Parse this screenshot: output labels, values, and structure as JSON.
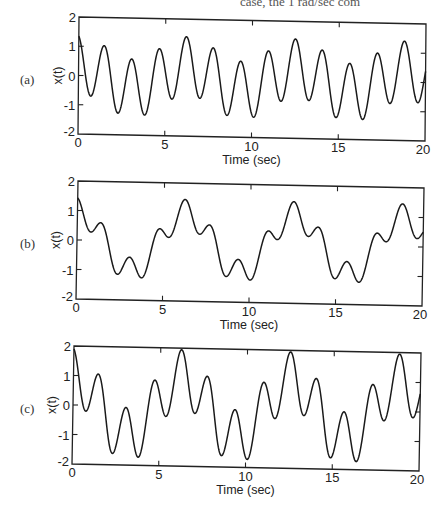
{
  "page": {
    "top_text_fragment": "case, the 1 rad/sec com"
  },
  "chart_data": [
    {
      "type": "line",
      "panel_label": "(a)",
      "title": "",
      "xlabel": "Time (sec)",
      "ylabel": "x(t)",
      "xlim": [
        0,
        20
      ],
      "ylim": [
        -2,
        2
      ],
      "xticks": [
        "0",
        "5",
        "10",
        "15",
        "20"
      ],
      "yticks": [
        "2",
        "1",
        "0",
        "-1",
        "-2"
      ],
      "grid": false,
      "legend": null,
      "components": [
        {
          "freq_rad_per_sec": 1,
          "amplitude": 0.4,
          "phase": 0.0
        },
        {
          "freq_rad_per_sec": 4,
          "amplitude": 1.0,
          "phase": 0.33
        },
        {
          "freq_rad_per_sec": 2,
          "amplitude": 0.0,
          "phase": 0.0
        }
      ],
      "extrema_points": [
        [
          0,
          0.95
        ],
        [
          0.6,
          -0.6
        ],
        [
          1.4,
          1.1
        ],
        [
          2.2,
          -1.3
        ],
        [
          3.0,
          0.45
        ],
        [
          3.7,
          -1.5
        ],
        [
          4.6,
          0.8
        ],
        [
          5.3,
          -0.8
        ],
        [
          6.2,
          1.4
        ],
        [
          7.0,
          -0.65
        ],
        [
          7.8,
          1.05
        ],
        [
          8.5,
          -1.3
        ],
        [
          9.2,
          0.35
        ],
        [
          9.9,
          -1.55
        ],
        [
          10.9,
          0.7
        ],
        [
          11.6,
          -0.95
        ],
        [
          12.5,
          1.4
        ],
        [
          13.2,
          -0.4
        ],
        [
          13.9,
          1.15
        ],
        [
          14.8,
          -1.2
        ],
        [
          15.6,
          0.45
        ],
        [
          16.2,
          -1.7
        ],
        [
          17.1,
          0.8
        ],
        [
          17.9,
          -0.85
        ],
        [
          18.8,
          1.25
        ],
        [
          19.5,
          -0.5
        ],
        [
          20,
          0.85
        ]
      ],
      "box": {
        "x0": 79,
        "y0": 17,
        "x1": 426,
        "y1": 24,
        "bl_x": 78,
        "bl_y": 134,
        "br_y": 141
      }
    },
    {
      "type": "line",
      "panel_label": "(b)",
      "title": "",
      "xlabel": "Time (sec)",
      "ylabel": "x(t)",
      "xlim": [
        0,
        20
      ],
      "ylim": [
        -2,
        2
      ],
      "xticks": [
        "0",
        "5",
        "10",
        "15",
        "20"
      ],
      "yticks": [
        "2",
        "1",
        "0",
        "-1",
        "-2"
      ],
      "grid": false,
      "legend": null,
      "components": [
        {
          "freq_rad_per_sec": 1,
          "amplitude": 1.0,
          "phase": 0.0
        },
        {
          "freq_rad_per_sec": 4,
          "amplitude": 0.45,
          "phase": 0.33
        },
        {
          "freq_rad_per_sec": 2,
          "amplitude": 0.0,
          "phase": 0.0
        }
      ],
      "extrema_points": [
        [
          0,
          1.2
        ],
        [
          0.5,
          0.35
        ],
        [
          1.3,
          0.8
        ],
        [
          2.3,
          -1.05
        ],
        [
          3.0,
          -0.5
        ],
        [
          3.7,
          -1.45
        ],
        [
          4.6,
          0.25
        ],
        [
          5.2,
          -0.1
        ],
        [
          6.2,
          1.45
        ],
        [
          7.0,
          0.3
        ],
        [
          7.7,
          0.75
        ],
        [
          8.5,
          -1.05
        ],
        [
          9.2,
          -0.55
        ],
        [
          9.9,
          -1.5
        ],
        [
          10.9,
          0.2
        ],
        [
          11.5,
          -0.05
        ],
        [
          12.5,
          1.4
        ],
        [
          13.3,
          0.3
        ],
        [
          13.9,
          0.75
        ],
        [
          14.8,
          -1.0
        ],
        [
          15.5,
          -0.5
        ],
        [
          16.2,
          -1.55
        ],
        [
          17.1,
          0.2
        ],
        [
          17.7,
          -0.1
        ],
        [
          18.8,
          1.35
        ],
        [
          19.5,
          0.3
        ],
        [
          20,
          0.65
        ]
      ],
      "box": {
        "x0": 78,
        "y0": 181,
        "x1": 424,
        "y1": 188,
        "bl_x": 76,
        "bl_y": 299,
        "br_y": 306
      }
    },
    {
      "type": "line",
      "panel_label": "(c)",
      "title": "",
      "xlabel": "Time (sec)",
      "ylabel": "x(t)",
      "xlim": [
        0,
        20
      ],
      "ylim": [
        -2,
        2
      ],
      "xticks": [
        "0",
        "5",
        "10",
        "15",
        "20"
      ],
      "yticks": [
        "2",
        "1",
        "0",
        "-1",
        "-2"
      ],
      "grid": false,
      "legend": null,
      "components": [
        {
          "freq_rad_per_sec": 1,
          "amplitude": 1.0,
          "phase": 0.0
        },
        {
          "freq_rad_per_sec": 4,
          "amplitude": 0.95,
          "phase": 0.33
        },
        {
          "freq_rad_per_sec": 2,
          "amplitude": 0.0,
          "phase": 0.0
        }
      ],
      "extrema_points": [
        [
          0,
          1.6
        ],
        [
          0.6,
          -0.15
        ],
        [
          1.4,
          1.25
        ],
        [
          2.2,
          -1.55
        ],
        [
          3.0,
          0.0
        ],
        [
          3.7,
          -1.9
        ],
        [
          4.6,
          0.7
        ],
        [
          5.3,
          -0.6
        ],
        [
          6.2,
          1.95
        ],
        [
          7.0,
          -0.2
        ],
        [
          7.8,
          1.2
        ],
        [
          8.5,
          -1.6
        ],
        [
          9.2,
          -0.05
        ],
        [
          9.9,
          -2.0
        ],
        [
          10.9,
          0.6
        ],
        [
          11.6,
          -0.7
        ],
        [
          12.5,
          1.95
        ],
        [
          13.2,
          -0.05
        ],
        [
          13.9,
          1.15
        ],
        [
          14.8,
          -1.5
        ],
        [
          15.6,
          -0.2
        ],
        [
          16.2,
          -2.0
        ],
        [
          17.1,
          0.55
        ],
        [
          17.8,
          -0.75
        ],
        [
          18.8,
          1.85
        ],
        [
          19.5,
          -0.15
        ],
        [
          20,
          0.8
        ]
      ],
      "box": {
        "x0": 74,
        "y0": 346,
        "x1": 421,
        "y1": 353,
        "bl_x": 72,
        "bl_y": 464,
        "br_y": 471
      }
    }
  ]
}
